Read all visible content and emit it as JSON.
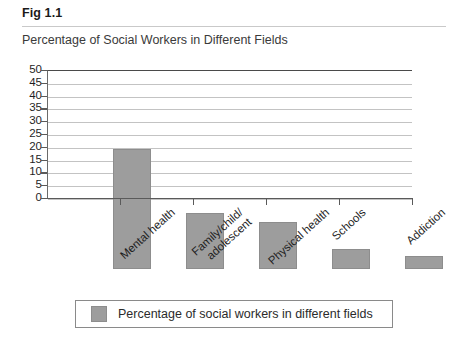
{
  "figure": {
    "label": "Fig 1.1",
    "subtitle": "Percentage of Social Workers in Different Fields"
  },
  "legend": {
    "swatch_color": "#9d9d9d",
    "text": "Percentage of social workers in different fields"
  },
  "colors": {
    "bar_fill": "#9d9d9d",
    "gridline": "#c3c3c3",
    "axis": "#5a5a5a",
    "text": "#1f1f1f"
  },
  "chart_data": {
    "type": "bar",
    "title": "Percentage of Social Workers in Different Fields",
    "xlabel": "",
    "ylabel": "",
    "ylim": [
      0,
      50
    ],
    "yticks": [
      0,
      5,
      10,
      15,
      20,
      25,
      30,
      35,
      40,
      45,
      50
    ],
    "ytick_labels": [
      "0",
      "5",
      "10",
      "15",
      "20",
      "25",
      "30",
      "35",
      "40",
      "45",
      "50"
    ],
    "grid": true,
    "legend_position": "bottom",
    "categories": [
      "Mental health",
      "Family/child/\nadolescent",
      "Physical health",
      "Schools",
      "Addiction"
    ],
    "category_lines": [
      [
        "Mental health"
      ],
      [
        "Family/child/",
        "adolescent"
      ],
      [
        "Physical health"
      ],
      [
        "Schools"
      ],
      [
        "Addiction"
      ]
    ],
    "series": [
      {
        "name": "Percentage of social workers in different fields",
        "values": [
          47,
          22,
          18.5,
          8,
          5
        ]
      }
    ]
  }
}
